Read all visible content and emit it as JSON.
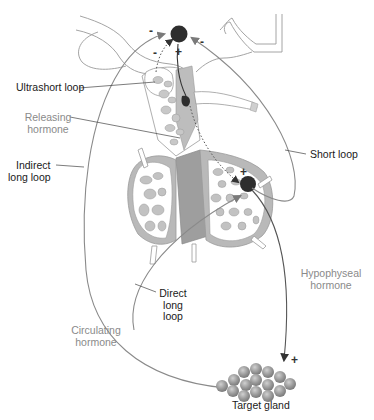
{
  "diagram": {
    "labels": {
      "ultrashort_loop": "Ultrashort loop",
      "releasing_hormone": [
        "Releasing",
        "hormone"
      ],
      "indirect_long_loop": [
        "Indirect",
        "long loop"
      ],
      "short_loop": "Short loop",
      "direct_long_loop": [
        "Direct",
        "long",
        "loop"
      ],
      "hypophyseal_hormone": [
        "Hypophyseal",
        "hormone"
      ],
      "circulating_hormone": [
        "Circulating",
        "hormone"
      ],
      "target_gland": "Target gland"
    },
    "signs": {
      "top_left_minus": "-",
      "top_inner_minus": "-",
      "top_plus": "+",
      "top_right_minus": "-",
      "pituitary_plus": "+",
      "target_plus": "+"
    },
    "colors": {
      "line_dark": "#333333",
      "line_grey": "#8a8a8a",
      "node_fill": "#3a3a3a",
      "tissue_grey": "#bdbdbd",
      "tissue_dark": "#9e9e9e",
      "label_dark": "#1a1a1a",
      "label_grey": "#8a8a8a"
    }
  }
}
